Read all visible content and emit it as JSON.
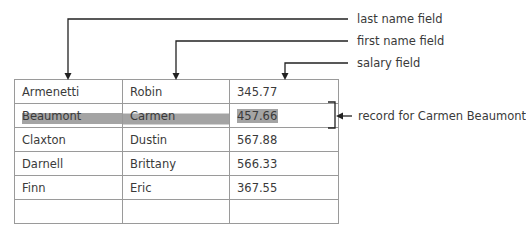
{
  "annotations": {
    "last_name_field": "last name field",
    "first_name_field": "first name field",
    "salary_field": "salary field",
    "record_label": "record for Carmen Beaumont"
  },
  "table": {
    "highlighted_row_index": 1,
    "rows": [
      {
        "last_name": "Armenetti",
        "first_name": "Robin",
        "salary": "345.77"
      },
      {
        "last_name": "Beaumont",
        "first_name": "Carmen",
        "salary": "457.66"
      },
      {
        "last_name": "Claxton",
        "first_name": "Dustin",
        "salary": "567.88"
      },
      {
        "last_name": "Darnell",
        "first_name": "Brittany",
        "salary": "566.33"
      },
      {
        "last_name": "Finn",
        "first_name": "Eric",
        "salary": "367.55"
      },
      {
        "last_name": "",
        "first_name": "",
        "salary": ""
      }
    ]
  },
  "colors": {
    "highlight": "#a4a4a4",
    "border": "#9a9a9a",
    "arrow": "#222222",
    "text": "#3a3a3a"
  }
}
